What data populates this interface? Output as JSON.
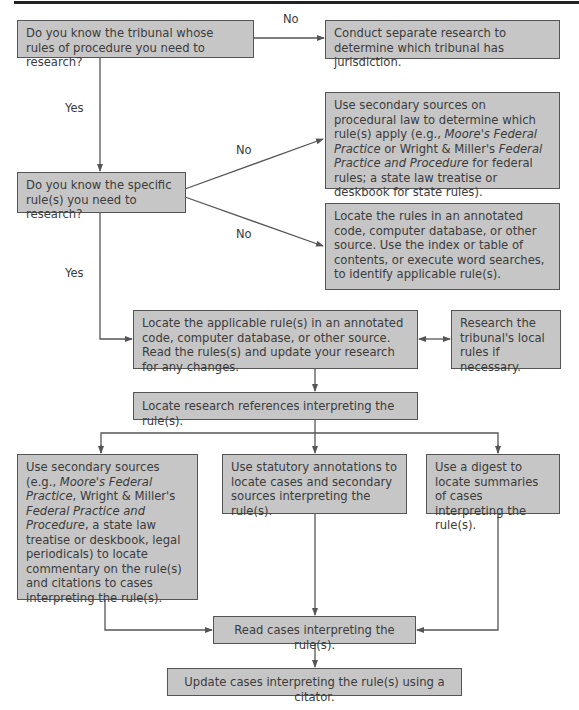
{
  "diagram": {
    "type": "flowchart",
    "nodes": {
      "q_tribunal": "Do you know the tribunal whose rules of procedure you need to research?",
      "conduct_separate": "Conduct separate research to determine which tribunal has jurisdiction.",
      "secondary_procedural": {
        "part1": "Use secondary sources on procedural law to determine which rule(s) apply (e.g., ",
        "italic1": "Moore's Federal Practice",
        "part2": " or Wright & Miller's ",
        "italic2": "Federal Practice and Procedure",
        "part3": " for federal rules; a state law treatise or deskbook for state rules)."
      },
      "q_specific_rule": "Do you know the specific rule(s) you need to research?",
      "locate_rules_annotated": "Locate the rules in an annotated code, computer database, or other source. Use the index or table of contents, or execute word searches, to identify applicable rule(s).",
      "locate_applicable": "Locate the applicable rule(s) in an annotated code, computer database, or other source. Read the rules(s) and update your research for any changes.",
      "local_rules": "Research the tribunal's local rules if necessary.",
      "locate_references": "Locate research references interpreting the rule(s).",
      "secondary_sources": {
        "part1": "Use secondary sources (e.g., ",
        "italic1": "Moore's Federal Practice",
        "part2": ", Wright & Miller's ",
        "italic2": "Federal Practice and Procedure",
        "part3": ", a state law treatise or deskbook, legal periodicals) to locate commentary on the rule(s) and citations to cases interpreting the rule(s)."
      },
      "statutory_annotations": "Use statutory annotations to locate cases and secondary sources interpreting the rule(s).",
      "digest": "Use a digest to locate summaries of cases interpreting the rule(s).",
      "read_cases": "Read cases interpreting the rule(s).",
      "update_cases": "Update cases interpreting the rule(s) using a citator."
    },
    "edge_labels": {
      "no_tribunal": "No",
      "yes_tribunal": "Yes",
      "no_rule_upper": "No",
      "no_rule_lower": "No",
      "yes_rule": "Yes"
    },
    "colors": {
      "box_fill": "#c6c6c6",
      "box_border": "#555555",
      "line": "#555555",
      "text": "#3b3b3b",
      "top_rule": "#222222"
    }
  }
}
